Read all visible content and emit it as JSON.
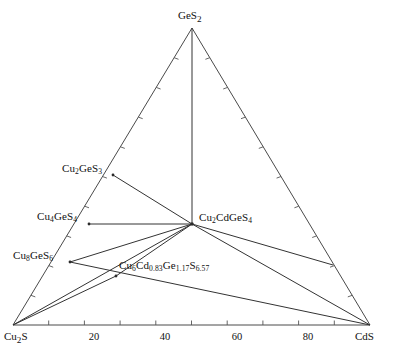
{
  "figure": {
    "type": "ternary-phase-diagram",
    "background_color": "#ffffff",
    "line_color": "#333333",
    "text_color": "#111111"
  },
  "corners": {
    "left": {
      "label_html": "Cu<sub>2</sub>S",
      "label_plain": "Cu2S",
      "composition_pct": 0
    },
    "right": {
      "label_html": "CdS",
      "label_plain": "CdS",
      "composition_pct": 100
    },
    "apex": {
      "label_html": "GeS<sub>2</sub>",
      "label_plain": "GeS2"
    }
  },
  "axis": {
    "bottom_tick_labels": [
      "20",
      "40",
      "60",
      "80"
    ],
    "bottom_tick_values": [
      20,
      40,
      60,
      80
    ],
    "minor_tick_interval": 10
  },
  "phases": {
    "cu2ges3": {
      "label_html": "Cu<sub>2</sub>GeS<sub>3</sub>",
      "label_plain": "Cu2GeS3"
    },
    "cu4ges4": {
      "label_html": "Cu<sub>4</sub>GeS<sub>4</sub>",
      "label_plain": "Cu4GeS4"
    },
    "cu8ges6": {
      "label_html": "Cu<sub>8</sub>GeS<sub>6</sub>",
      "label_plain": "Cu8GeS6"
    },
    "cu2cdges4": {
      "label_html": "Cu<sub>2</sub>CdGeS<sub>4</sub>",
      "label_plain": "Cu2CdGeS4"
    },
    "quaternary": {
      "label_html": "Cu<sub>6</sub>Cd<sub>0.83</sub>Ge<sub>1.17</sub>S<sub>6.57</sub>",
      "label_plain": "Cu6Cd0.83Ge1.17S6.57"
    }
  },
  "chart_data": {
    "type": "scatter",
    "title": "",
    "xlabel": "",
    "ylabel": "",
    "plot_kind": "ternary phase diagram (Cu2S - GeS2 - CdS)",
    "vertices": [
      {
        "name": "Cu2S",
        "x": 13,
        "y": 325
      },
      {
        "name": "CdS",
        "x": 370,
        "y": 325
      },
      {
        "name": "GeS2",
        "x": 192,
        "y": 28
      }
    ],
    "nodes": [
      {
        "name": "Cu2S",
        "x": 13,
        "y": 325,
        "on_edge": "bottom"
      },
      {
        "name": "CdS",
        "x": 370,
        "y": 325,
        "on_edge": "bottom"
      },
      {
        "name": "GeS2",
        "x": 192,
        "y": 28,
        "on_edge": "apex"
      },
      {
        "name": "Cu2GeS3",
        "x": 113,
        "y": 175,
        "on_edge": "left"
      },
      {
        "name": "Cu4GeS4",
        "x": 89,
        "y": 224,
        "on_edge": "left"
      },
      {
        "name": "Cu8GeS6",
        "x": 70,
        "y": 262,
        "on_edge": "left"
      },
      {
        "name": "Cu2CdGeS4",
        "x": 192,
        "y": 224,
        "on_edge": "interior"
      },
      {
        "name": "Cu6Cd0.83Ge1.17S6.57",
        "x": 116,
        "y": 276,
        "on_edge": "interior"
      },
      {
        "name": "right-edge-join",
        "x": 333,
        "y": 265,
        "on_edge": "right"
      }
    ],
    "tie_lines": [
      {
        "from": "GeS2",
        "to": "Cu2CdGeS4"
      },
      {
        "from": "Cu2GeS3",
        "to": "Cu2CdGeS4"
      },
      {
        "from": "Cu4GeS4",
        "to": "Cu2CdGeS4"
      },
      {
        "from": "Cu8GeS6",
        "to": "Cu2CdGeS4"
      },
      {
        "from": "Cu2CdGeS4",
        "to": "right-edge-join"
      },
      {
        "from": "Cu2CdGeS4",
        "to": "CdS"
      },
      {
        "from": "Cu2CdGeS4",
        "to": "Cu6Cd0.83Ge1.17S6.57"
      },
      {
        "from": "Cu6Cd0.83Ge1.17S6.57",
        "to": "Cu8GeS6"
      },
      {
        "from": "Cu6Cd0.83Ge1.17S6.57",
        "to": "Cu2S"
      },
      {
        "from": "Cu6Cd0.83Ge1.17S6.57",
        "to": "CdS"
      },
      {
        "from": "Cu2S",
        "to": "CdS"
      },
      {
        "from": "Cu2S",
        "to": "Cu2CdGeS4"
      }
    ],
    "axis_ticks": {
      "bottom": [
        20,
        40,
        60,
        80
      ],
      "range": [
        0,
        100
      ]
    },
    "grid": false,
    "legend": "none"
  }
}
